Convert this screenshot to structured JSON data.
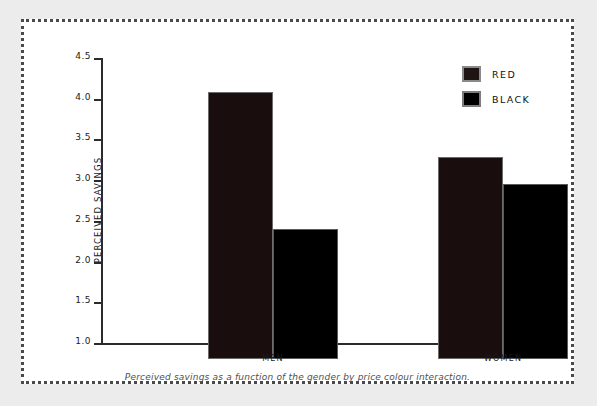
{
  "caption": "Perceived savings as a function of the gender by price colour interaction.",
  "legend": {
    "items": [
      {
        "label": "RED",
        "color": "#1a0d0d"
      },
      {
        "label": "BLACK",
        "color": "#000000"
      }
    ]
  },
  "chart_data": {
    "type": "bar",
    "title": "",
    "xlabel": "",
    "ylabel": "PERCEIVED SAVINGS",
    "categories": [
      "MEN",
      "WOMEN"
    ],
    "series": [
      {
        "name": "RED",
        "values": [
          4.28,
          3.48
        ],
        "color": "#1a0d0d"
      },
      {
        "name": "BLACK",
        "values": [
          2.6,
          3.15
        ],
        "color": "#000000"
      }
    ],
    "ylim": [
      1.0,
      4.5
    ],
    "yticks": [
      "1.0",
      "1.5",
      "2.0",
      "2.5",
      "3.0",
      "3.5",
      "4.0",
      "4.5"
    ],
    "ytick_values": [
      1.0,
      1.5,
      2.0,
      2.5,
      3.0,
      3.5,
      4.0,
      4.5
    ],
    "grid": false,
    "legend_position": "top-right"
  }
}
